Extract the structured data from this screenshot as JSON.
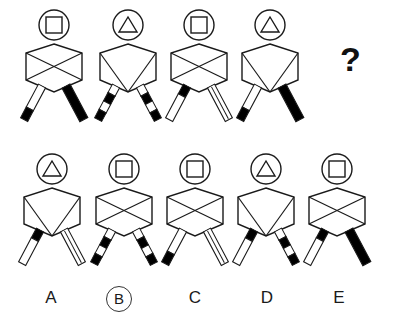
{
  "puzzle": {
    "type": "matrix-reasoning",
    "title": "Figure analogy puzzle",
    "question_mark": "?",
    "selected_option": "B",
    "canvas": {
      "width": 394,
      "height": 331
    },
    "stroke_color": "#1a1a1a",
    "fill_black": "#000000",
    "fill_white": "#ffffff"
  },
  "prompt_row": {
    "name": "prompt-sequence",
    "figures": [
      {
        "id": "prompt-1",
        "head_shape": "square",
        "body_pattern": "x-cross",
        "left_leg": "white-with-black-foot",
        "right_leg": "solid-black",
        "x": 18,
        "y": 8
      },
      {
        "id": "prompt-2",
        "head_shape": "triangle",
        "body_pattern": "v-split",
        "left_leg": "striped",
        "right_leg": "striped",
        "x": 92,
        "y": 8
      },
      {
        "id": "prompt-3",
        "head_shape": "square",
        "body_pattern": "x-cross",
        "left_leg": "black-hip-white-foot",
        "right_leg": "outlined-white",
        "x": 163,
        "y": 8
      },
      {
        "id": "prompt-4",
        "head_shape": "triangle",
        "body_pattern": "v-split",
        "left_leg": "white-with-black-foot",
        "right_leg": "solid-black",
        "x": 234,
        "y": 8
      }
    ]
  },
  "answer_row": {
    "name": "answer-options",
    "options": [
      {
        "id": "option-A",
        "label": "A",
        "selected": false,
        "head_shape": "triangle",
        "body_pattern": "v-split",
        "left_leg": "black-hip-white-foot",
        "right_leg": "outlined-white",
        "x": 16,
        "y": 152,
        "label_x": 34
      },
      {
        "id": "option-B",
        "label": "B",
        "selected": true,
        "head_shape": "square",
        "body_pattern": "x-cross",
        "left_leg": "striped",
        "right_leg": "striped",
        "x": 88,
        "y": 152,
        "label_x": 106
      },
      {
        "id": "option-C",
        "label": "C",
        "selected": false,
        "head_shape": "square",
        "body_pattern": "x-cross",
        "left_leg": "white-with-black-foot",
        "right_leg": "outlined-white",
        "x": 159,
        "y": 152,
        "label_x": 178
      },
      {
        "id": "option-D",
        "label": "D",
        "selected": false,
        "head_shape": "triangle",
        "body_pattern": "v-split",
        "left_leg": "black-hip-white-foot",
        "right_leg": "striped",
        "x": 230,
        "y": 152,
        "label_x": 250
      },
      {
        "id": "option-E",
        "label": "E",
        "selected": false,
        "head_shape": "square",
        "body_pattern": "x-cross",
        "left_leg": "black-hip-white-foot",
        "right_leg": "solid-black",
        "x": 301,
        "y": 152,
        "label_x": 322
      }
    ]
  },
  "question_cell": {
    "name": "missing-figure-placeholder",
    "text": "?",
    "x": 340,
    "y": 40
  }
}
